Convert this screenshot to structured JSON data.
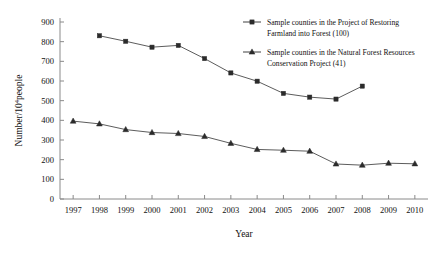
{
  "chart_data": {
    "type": "line",
    "title": "",
    "xlabel": "Year",
    "ylabel": "Number/10⁴people",
    "ylabel_base": "Number/10",
    "ylabel_exponent": "4",
    "ylabel_suffix": "people",
    "categories": [
      1997,
      1998,
      1999,
      2000,
      2001,
      2002,
      2003,
      2004,
      2005,
      2006,
      2007,
      2008,
      2009,
      2010
    ],
    "x_tick_labels": [
      "1997",
      "1998",
      "1999",
      "2000",
      "2001",
      "2002",
      "2003",
      "2004",
      "2005",
      "2006",
      "2007",
      "2008",
      "2009",
      "2010"
    ],
    "y_tick_labels": [
      "0",
      "100",
      "200",
      "300",
      "400",
      "500",
      "600",
      "700",
      "800",
      "900"
    ],
    "y_ticks": [
      0,
      100,
      200,
      300,
      400,
      500,
      600,
      700,
      800,
      900
    ],
    "ylim": [
      0,
      900
    ],
    "grid": false,
    "legend_position": "top-right",
    "series": [
      {
        "name": "Sample counties in the Project of Restoring Farmland into Forest (100)",
        "name_line1": "Sample counties in the Project of Restoring",
        "name_line2": "Farmland into Forest (100)",
        "marker": "square",
        "color": "#2b2b2b",
        "x": [
          1998,
          1999,
          2000,
          2001,
          2002,
          2003,
          2004,
          2005,
          2006,
          2007,
          2008
        ],
        "values": [
          830,
          802,
          772,
          781,
          714,
          641,
          599,
          537,
          518,
          508,
          574
        ]
      },
      {
        "name": "Sample counties in the Natural Forest Resources Conservation Project (41)",
        "name_line1": "Sample counties in the Natural Forest Resources",
        "name_line2": "Conservation Project (41)",
        "marker": "triangle",
        "color": "#2b2b2b",
        "x": [
          1997,
          1998,
          1999,
          2000,
          2001,
          2002,
          2003,
          2004,
          2005,
          2006,
          2007,
          2008,
          2009,
          2010
        ],
        "values": [
          396,
          382,
          353,
          338,
          333,
          318,
          283,
          252,
          248,
          243,
          178,
          172,
          182,
          179
        ]
      }
    ]
  }
}
